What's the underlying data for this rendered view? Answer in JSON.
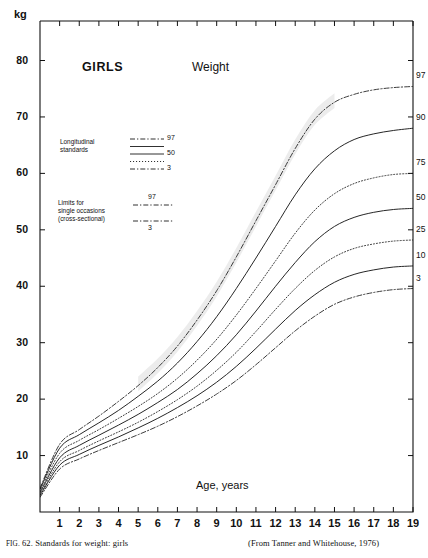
{
  "figure": {
    "title_group": "GIRLS",
    "title_measure": "Weight",
    "unit_label": "kg",
    "xaxis_label": "Age, years",
    "caption_left_prefix": "FIG.",
    "caption_left": " 62. Standards for weight: girls",
    "caption_right": "(From Tanner and Whitehouse, 1976)"
  },
  "legend": {
    "longitudinal": {
      "label_line1": "Longitudinal",
      "label_line2": "standards",
      "entries": [
        {
          "label": "97",
          "style": "dashdot"
        },
        {
          "label": "",
          "style": "solid"
        },
        {
          "label": "50",
          "style": "solid"
        },
        {
          "label": "",
          "style": "dotted"
        },
        {
          "label": "3",
          "style": "dashdot"
        }
      ]
    },
    "cross_sectional": {
      "label_line1": "Limits for",
      "label_line2": "single occasions",
      "label_line3": "(cross-sectional)",
      "entries": [
        {
          "label": "97",
          "style": "dashdot"
        },
        {
          "label": "3",
          "style": "dashdot"
        }
      ]
    }
  },
  "chart_data": {
    "type": "line",
    "title": "GIRLS Weight",
    "xlabel": "Age, years",
    "ylabel": "kg",
    "xlim": [
      0,
      19
    ],
    "ylim": [
      0,
      87
    ],
    "grid": false,
    "legend_position": "inside-left",
    "x_ticks": [
      1,
      2,
      3,
      4,
      5,
      6,
      7,
      8,
      9,
      10,
      11,
      12,
      13,
      14,
      15,
      16,
      17,
      18,
      19
    ],
    "y_ticks": [
      10,
      20,
      30,
      40,
      50,
      60,
      70,
      80
    ],
    "right_labels": [
      "97",
      "90",
      "75",
      "50",
      "25",
      "10",
      "3"
    ],
    "x": [
      0,
      1,
      2,
      3,
      4,
      5,
      6,
      7,
      8,
      9,
      10,
      11,
      12,
      13,
      14,
      15,
      16,
      17,
      18,
      19
    ],
    "series": [
      {
        "name": "97",
        "kind": "cross-sectional",
        "style": "dashdot",
        "right_label": "97",
        "values": [
          4.2,
          12.0,
          14.6,
          17.0,
          19.6,
          22.4,
          25.6,
          29.4,
          34.0,
          39.2,
          45.2,
          51.6,
          58.0,
          64.4,
          69.6,
          72.6,
          74.0,
          74.8,
          75.2,
          75.4
        ]
      },
      {
        "name": "90",
        "kind": "longitudinal",
        "style": "solid",
        "right_label": "90",
        "values": [
          4.0,
          11.3,
          13.7,
          15.8,
          18.0,
          20.5,
          23.2,
          26.4,
          30.2,
          34.6,
          39.6,
          45.0,
          50.6,
          56.2,
          60.8,
          64.0,
          66.0,
          67.0,
          67.6,
          68.0
        ]
      },
      {
        "name": "75",
        "kind": "longitudinal",
        "style": "dotted",
        "right_label": "75",
        "values": [
          3.7,
          10.4,
          12.7,
          14.6,
          16.6,
          18.7,
          21.0,
          23.7,
          26.9,
          30.6,
          34.9,
          39.6,
          44.5,
          49.4,
          53.5,
          56.4,
          58.2,
          59.2,
          59.8,
          60.0
        ]
      },
      {
        "name": "50",
        "kind": "longitudinal",
        "style": "solid",
        "right_label": "50",
        "values": [
          3.4,
          9.6,
          11.8,
          13.6,
          15.4,
          17.3,
          19.4,
          21.7,
          24.5,
          27.7,
          31.4,
          35.6,
          40.0,
          44.2,
          47.9,
          50.6,
          52.2,
          53.1,
          53.6,
          53.8
        ]
      },
      {
        "name": "25",
        "kind": "longitudinal",
        "style": "dotted",
        "right_label": "25",
        "values": [
          3.1,
          8.9,
          10.9,
          12.6,
          14.2,
          15.9,
          17.8,
          19.9,
          22.3,
          25.1,
          28.3,
          32.0,
          35.9,
          39.6,
          42.8,
          45.2,
          46.7,
          47.5,
          48.0,
          48.2
        ]
      },
      {
        "name": "10",
        "kind": "longitudinal",
        "style": "solid",
        "right_label": "10",
        "values": [
          2.9,
          8.3,
          10.2,
          11.8,
          13.3,
          14.9,
          16.6,
          18.5,
          20.6,
          23.0,
          25.8,
          29.0,
          32.4,
          35.7,
          38.5,
          40.7,
          42.1,
          42.9,
          43.4,
          43.6
        ]
      },
      {
        "name": "3",
        "kind": "cross-sectional",
        "style": "dashdot",
        "right_label": "3",
        "values": [
          2.6,
          7.6,
          9.4,
          10.9,
          12.3,
          13.7,
          15.2,
          16.9,
          18.8,
          20.9,
          23.3,
          26.1,
          29.1,
          32.1,
          34.7,
          36.8,
          38.1,
          38.9,
          39.4,
          39.6
        ]
      }
    ]
  }
}
